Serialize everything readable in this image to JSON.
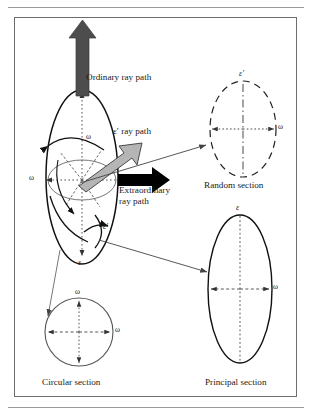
{
  "figure": {
    "type": "optical-indicatrix-diagram",
    "background": "#ffffff",
    "frame_border": "#6d6d6d"
  },
  "colors": {
    "ordinary_arrow": "#4d4d4d",
    "epsilon_prime_arrow": "#b5b5b5",
    "epsilon_prime_arrow_outline": "#3a3a3a",
    "extraordinary_arrow": "#000000",
    "curve": "#111111",
    "connector": "#444444",
    "axis_dash": "#333333"
  },
  "labels": {
    "ordinary_ray_path": "Ordinary ray path",
    "epsilon_prime_ray_path": "ε′ ray path",
    "extraordinary_ray_path_line1": "Extraordinary",
    "extraordinary_ray_path_line2": "ray path",
    "random_section": "Random section",
    "circular_section": "Circular section",
    "principal_section": "Principal section"
  },
  "symbols": {
    "omega": "ω",
    "epsilon": "ε",
    "epsilon_prime": "ε′"
  },
  "indicatrix": {
    "name": "uniaxial-positive-indicatrix",
    "axis_labels": {
      "vertical_bottom": "ε",
      "equator_left": "ω",
      "interior_upper": "ω",
      "right_edge": "ε′"
    }
  },
  "sections": [
    {
      "name": "random-section",
      "caption": "Random section",
      "shape": "ellipse",
      "stroke": "dashed",
      "vertical_axis_label": "ε′",
      "horizontal_axis_label": "ω"
    },
    {
      "name": "circular-section",
      "caption": "Circular section",
      "shape": "circle",
      "stroke": "solid",
      "vertical_axis_label": "ω",
      "horizontal_axis_label": "ω"
    },
    {
      "name": "principal-section",
      "caption": "Principal section",
      "shape": "ellipse",
      "stroke": "solid",
      "vertical_axis_label": "ε",
      "horizontal_axis_label": "ω"
    }
  ]
}
